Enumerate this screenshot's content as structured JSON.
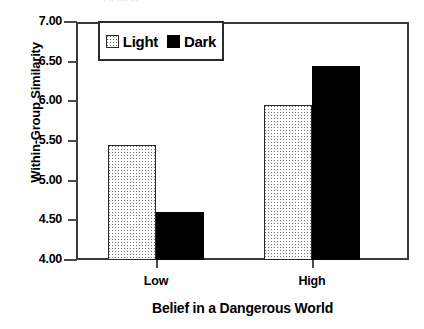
{
  "chart_data": {
    "type": "bar",
    "title": "",
    "xlabel": "Belief in a Dangerous World",
    "ylabel": "Within-Group Similarity",
    "categories": [
      "Low",
      "High"
    ],
    "series": [
      {
        "name": "Light",
        "values": [
          5.45,
          5.95
        ]
      },
      {
        "name": "Dark",
        "values": [
          4.6,
          6.45
        ]
      }
    ],
    "ylim": [
      4.0,
      7.0
    ],
    "ytick_labels": [
      "4.00",
      "4.50",
      "5.00",
      "5.50",
      "6.00",
      "6.50",
      "7.00"
    ],
    "ytick_values": [
      4.0,
      4.5,
      5.0,
      5.5,
      6.0,
      6.5,
      7.0
    ],
    "grid": false,
    "legend_position": "top-left-inside",
    "colors": {
      "light_series": "#ffffff",
      "light_series_pattern": "#7a7a7a",
      "dark_series": "#000000",
      "axis": "#3a3a3a",
      "text": "#000000",
      "background": "#ffffff"
    }
  },
  "legend": {
    "entries": [
      {
        "label": "Light",
        "swatch": "dotted-pattern-swatch"
      },
      {
        "label": "Dark",
        "swatch": "solid-black-swatch"
      }
    ]
  },
  "artifact": {
    "top_fragment": "· ·· ···· ···"
  }
}
